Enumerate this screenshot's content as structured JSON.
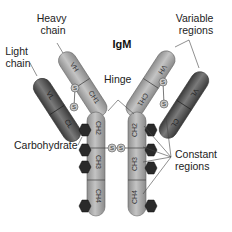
{
  "diagram": {
    "title": "IgM",
    "labels": {
      "light_chain": [
        "Light",
        "chain"
      ],
      "heavy_chain": [
        "Heavy",
        "chain"
      ],
      "variable_regions": [
        "Variable",
        "regions"
      ],
      "hinge": "Hinge",
      "carbohydrate": "Carbohydrate",
      "constant_regions": [
        "Constant",
        "regions"
      ]
    },
    "domains": {
      "vh": "VH",
      "ch1": "CH1",
      "ch2": "CH2",
      "ch3": "CH3",
      "ch4": "CH4",
      "vl": "VL",
      "cl": "CL"
    },
    "disulfide": "S",
    "colors": {
      "heavy_chain": "#a8a8a8",
      "light_chain": "#555555",
      "carbohydrate": "#2a2a2a",
      "leader_line": "#444444"
    }
  }
}
